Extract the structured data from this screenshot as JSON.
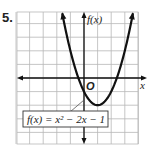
{
  "problem": {
    "number": "5."
  },
  "chart_data": {
    "type": "line",
    "title": "",
    "function_label": "f(x) = x² − 2x − 1",
    "xlabel": "x",
    "ylabel": "f(x)",
    "origin_label": "O",
    "xlim": [
      -5,
      4.5
    ],
    "ylim": [
      -5,
      4.8
    ],
    "grid": true,
    "grid_step": 1,
    "vertex": [
      1,
      -2
    ],
    "roots": [
      -0.414,
      2.414
    ],
    "y_intercept": [
      0,
      -1
    ],
    "x": [
      -1.6,
      -1,
      -0.5,
      0,
      0.5,
      1,
      1.5,
      2,
      2.5,
      3,
      3.6
    ],
    "values": [
      4.76,
      2,
      0.25,
      -1,
      -1.75,
      -2,
      -1.75,
      -1,
      0.25,
      2,
      4.76
    ],
    "colors": {
      "curve": "#111111",
      "grid": "#b8b8b8",
      "axes": "#111111"
    }
  }
}
